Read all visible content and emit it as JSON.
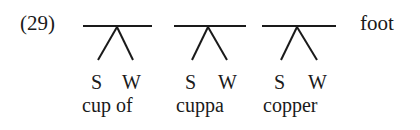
{
  "example_number": "(29)",
  "level_label": "foot",
  "trees": [
    {
      "word": "cupof",
      "display": "cup of",
      "strong": "S",
      "weak": "W"
    },
    {
      "word": "cuppa",
      "display": "cuppa",
      "strong": "S",
      "weak": "W"
    },
    {
      "word": "copper",
      "display": "copper",
      "strong": "S",
      "weak": "W"
    }
  ]
}
